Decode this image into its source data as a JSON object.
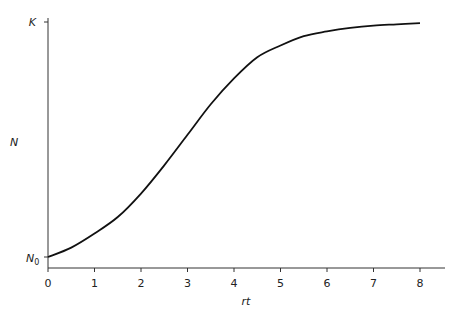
{
  "chart_data": {
    "type": "line",
    "title": "",
    "xlabel": "rt",
    "ylabel": "N",
    "xlim": [
      0,
      8
    ],
    "x_ticks": [
      "0",
      "1",
      "2",
      "3",
      "4",
      "5",
      "6",
      "7",
      "8"
    ],
    "y_ticks": [
      {
        "label": "K",
        "sub": "",
        "position": "top"
      },
      {
        "label": "N",
        "sub": "0",
        "position": "bottom"
      }
    ],
    "grid": false,
    "legend": null,
    "series": [
      {
        "name": "logistic growth",
        "x": [
          0,
          0.5,
          1,
          1.5,
          2,
          2.5,
          3,
          3.5,
          4,
          4.5,
          5,
          5.5,
          6,
          6.5,
          7,
          7.5,
          8
        ],
        "y_fraction_of_K": [
          0.0,
          0.04,
          0.1,
          0.17,
          0.27,
          0.39,
          0.52,
          0.65,
          0.76,
          0.85,
          0.9,
          0.94,
          0.96,
          0.975,
          0.985,
          0.99,
          0.995
        ]
      }
    ]
  }
}
